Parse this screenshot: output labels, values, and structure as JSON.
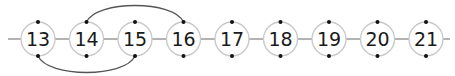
{
  "diagram": {
    "nodes": [
      "13",
      "14",
      "15",
      "16",
      "17",
      "18",
      "19",
      "20",
      "21"
    ],
    "arcs": [
      {
        "from": "14",
        "to": "16",
        "side": "top"
      },
      {
        "from": "13",
        "to": "15",
        "side": "bottom"
      }
    ],
    "colors": {
      "line": "#9a9a9a",
      "circle_stroke": "#c8c8c8",
      "arc": "#555555",
      "dot": "#111111",
      "text": "#1a1a1a"
    }
  }
}
